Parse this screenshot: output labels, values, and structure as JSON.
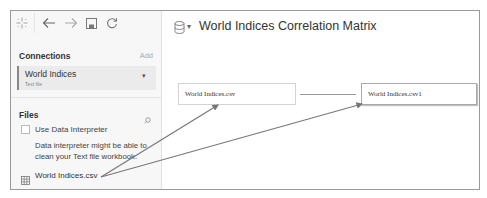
{
  "toolbar": {
    "icons": [
      "logo-icon",
      "back-icon",
      "forward-icon",
      "save-icon",
      "refresh-icon"
    ]
  },
  "sidebar": {
    "connections_label": "Connections",
    "add_label": "Add",
    "connection": {
      "name": "World Indices",
      "type": "Text file"
    },
    "files_label": "Files",
    "use_interpreter_label": "Use Data Interpreter",
    "interpreter_hint": "Data interpreter might be able to clean your Text file workbook.",
    "file_name": "World Indices.csv"
  },
  "main": {
    "datasource_title": "World Indices Correlation Matrix",
    "tables": [
      {
        "label": "World Indices.csv"
      },
      {
        "label": "World Indices.csv1"
      }
    ]
  },
  "annotation": {
    "arrow_color": "#777777"
  }
}
